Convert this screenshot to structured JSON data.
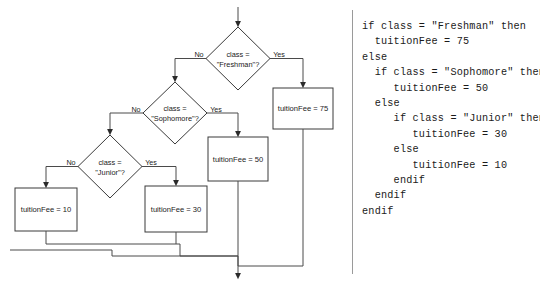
{
  "diagram": {
    "colors": {
      "background": "#ffffff",
      "shape_stroke": "#3a3a3a",
      "connector_stroke": "#4a4a4a",
      "text": "#1b1b1b",
      "divider": "#9a9a9a"
    },
    "decisions": [
      {
        "id": "freshman",
        "line1": "class =",
        "line2": "\"Freshman\"?",
        "no_label": "No",
        "yes_label": "Yes"
      },
      {
        "id": "sophomore",
        "line1": "class =",
        "line2": "\"Sophomore\"?",
        "no_label": "No",
        "yes_label": "Yes"
      },
      {
        "id": "junior",
        "line1": "class =",
        "line2": "\"Junior\"?",
        "no_label": "No",
        "yes_label": "Yes"
      }
    ],
    "processes": [
      {
        "id": "fee75",
        "label": "tuitionFee = 75"
      },
      {
        "id": "fee50",
        "label": "tuitionFee = 50"
      },
      {
        "id": "fee30",
        "label": "tuitionFee = 30"
      },
      {
        "id": "fee10",
        "label": "tuitionFee = 10"
      }
    ]
  },
  "code": {
    "language": "pseudocode",
    "lines": [
      "if class = \"Freshman\" then",
      "  tuitionFee = 75",
      "else",
      "  if class = \"Sophomore\" then",
      "     tuitionFee = 50",
      "  else",
      "     if class = \"Junior\" then",
      "        tuitionFee = 30",
      "     else",
      "        tuitionFee = 10",
      "     endif",
      "  endif",
      "endif"
    ],
    "text": "if class = \"Freshman\" then\n  tuitionFee = 75\nelse\n  if class = \"Sophomore\" then\n     tuitionFee = 50\n  else\n     if class = \"Junior\" then\n        tuitionFee = 30\n     else\n        tuitionFee = 10\n     endif\n  endif\nendif"
  }
}
